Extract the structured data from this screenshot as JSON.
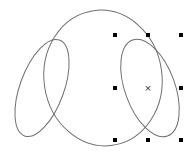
{
  "canvas": {
    "width": 192,
    "height": 158,
    "background": "#ffffff",
    "stroke_color": "#6f6f6f",
    "handle_color": "#000000"
  },
  "shapes": [
    {
      "name": "large-circle-ellipse",
      "cx": 103,
      "cy": 78,
      "rx": 59,
      "ry": 68,
      "rotation": -8,
      "selected": false
    },
    {
      "name": "left-ellipse",
      "cx": 42,
      "cy": 88,
      "rx": 22,
      "ry": 51,
      "rotation": 20,
      "selected": false
    },
    {
      "name": "right-ellipse",
      "cx": 150,
      "cy": 88,
      "rx": 25,
      "ry": 51,
      "rotation": -20,
      "selected": true
    }
  ],
  "selection": {
    "bbox": {
      "x1": 115,
      "y1": 35,
      "x2": 181,
      "y2": 140
    },
    "handles": [
      {
        "pos": "top-left",
        "x": 115,
        "y": 35
      },
      {
        "pos": "top-middle",
        "x": 148,
        "y": 35
      },
      {
        "pos": "top-right",
        "x": 181,
        "y": 35
      },
      {
        "pos": "middle-left",
        "x": 115,
        "y": 88
      },
      {
        "pos": "middle-right",
        "x": 181,
        "y": 88
      },
      {
        "pos": "bottom-left",
        "x": 115,
        "y": 140
      },
      {
        "pos": "bottom-middle",
        "x": 148,
        "y": 140
      },
      {
        "pos": "bottom-right",
        "x": 181,
        "y": 140
      }
    ],
    "center_marker": {
      "x": 148,
      "y": 88,
      "glyph": "×"
    }
  }
}
